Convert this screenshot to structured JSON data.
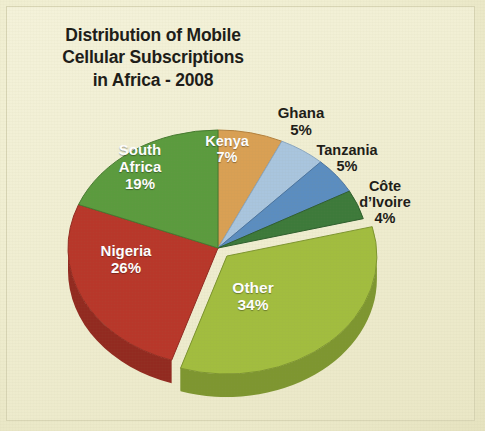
{
  "page": {
    "background_color": "#efedcf",
    "panel_color": "#f2f0d6"
  },
  "chart_data": {
    "type": "pie",
    "title": "Distribution of Mobile\nCellular Subscriptions\nin Africa - 2008",
    "title_lines": [
      "Distribution of Mobile",
      "Cellular Subscriptions",
      "in Africa - 2008"
    ],
    "xlabel": "",
    "ylabel": "",
    "legend_position": "none",
    "grid": false,
    "three_d": true,
    "units": "percent",
    "total": 100,
    "categories": [
      "Kenya",
      "Ghana",
      "Tanzania",
      "Côte d’Ivoire",
      "Other",
      "Nigeria",
      "South Africa"
    ],
    "values": [
      7,
      5,
      5,
      4,
      34,
      26,
      19
    ],
    "slices": [
      {
        "name": "Kenya",
        "label": "Kenya",
        "value": 7,
        "value_text": "7%",
        "color": "#d9a054",
        "side_color": "#b4813d",
        "label_placement": "inside",
        "label_color": "#ffffff",
        "exploded": false
      },
      {
        "name": "Ghana",
        "label": "Ghana",
        "value": 5,
        "value_text": "5%",
        "color": "#a9c5de",
        "side_color": "#8aa7c2",
        "label_placement": "outside",
        "label_color": "#1d1c18",
        "exploded": false
      },
      {
        "name": "Tanzania",
        "label": "Tanzania",
        "value": 5,
        "value_text": "5%",
        "color": "#5b8dc0",
        "side_color": "#4a74a0",
        "label_placement": "outside",
        "label_color": "#1d1c18",
        "exploded": false
      },
      {
        "name": "Cote d'Ivoire",
        "label": "Côte\nd’Ivoire",
        "value": 4,
        "value_text": "4%",
        "color": "#3d7a3a",
        "side_color": "#2f5f2d",
        "label_placement": "outside",
        "label_color": "#1d1c18",
        "exploded": false
      },
      {
        "name": "Other",
        "label": "Other",
        "value": 34,
        "value_text": "34%",
        "color": "#a2bd3f",
        "side_color": "#7e9630",
        "label_placement": "inside",
        "label_color": "#ffffff",
        "exploded": true
      },
      {
        "name": "Nigeria",
        "label": "Nigeria",
        "value": 26,
        "value_text": "26%",
        "color": "#b8372a",
        "side_color": "#922a20",
        "label_placement": "inside",
        "label_color": "#ffffff",
        "exploded": false
      },
      {
        "name": "South Africa",
        "label": "South\nAfrica",
        "value": 19,
        "value_text": "19%",
        "color": "#5b9b3e",
        "side_color": "#477a30",
        "label_placement": "inside",
        "label_color": "#ffffff",
        "exploded": false
      }
    ]
  },
  "labels": {
    "south_africa": "South\nAfrica\n19%",
    "nigeria": "Nigeria\n26%",
    "other": "Other\n34%",
    "kenya": "Kenya\n7%",
    "ghana": "Ghana\n5%",
    "tanzania": "Tanzania\n5%",
    "cote_divoire": "Côte\nd’Ivoire\n4%"
  }
}
